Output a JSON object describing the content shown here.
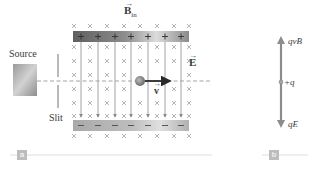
{
  "figure": {
    "panel_a": {
      "tag": "a",
      "labels": {
        "source": "Source",
        "slit": "Slit",
        "magnetic_field": "B",
        "magnetic_field_sub": "in",
        "electric_field": "E",
        "velocity": "v"
      },
      "top_plate_sign": "+",
      "bottom_plate_sign": "−",
      "plate_charge_count": 7,
      "field_line_count": 7
    },
    "panel_b": {
      "tag": "b",
      "labels": {
        "upward_force": "qvB",
        "charge": "+q",
        "downward_force": "qE"
      }
    },
    "colors": {
      "plate_dark": "#6e6e6e",
      "plate_light": "#d8d8d8",
      "field_line": "#8a8a8a",
      "x_mark": "#b0b0b0",
      "velocity_arrow": "#2a2a2a",
      "force_arrow": "#8c8c8c",
      "tag_bg": "#bdbdbd",
      "rule": "#d6d6d6"
    }
  }
}
